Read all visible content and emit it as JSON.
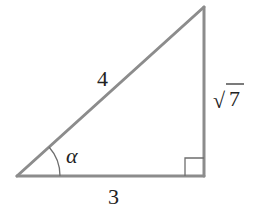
{
  "diagram": {
    "type": "right-triangle",
    "colors": {
      "stroke": "#8c8c8c",
      "text": "#222222",
      "background": "#ffffff"
    },
    "vertices": {
      "bottom_left": [
        17,
        176
      ],
      "bottom_right": [
        204,
        176
      ],
      "top": [
        204,
        7
      ]
    },
    "labels": {
      "hypotenuse": "4",
      "vertical_leg_radicand": "7",
      "vertical_leg_radical": "√",
      "horizontal_leg": "3",
      "angle": "α"
    },
    "marks": {
      "right_angle": "right-angle-square at bottom-right vertex",
      "angle_arc": "arc marking angle α at bottom-left vertex"
    }
  }
}
